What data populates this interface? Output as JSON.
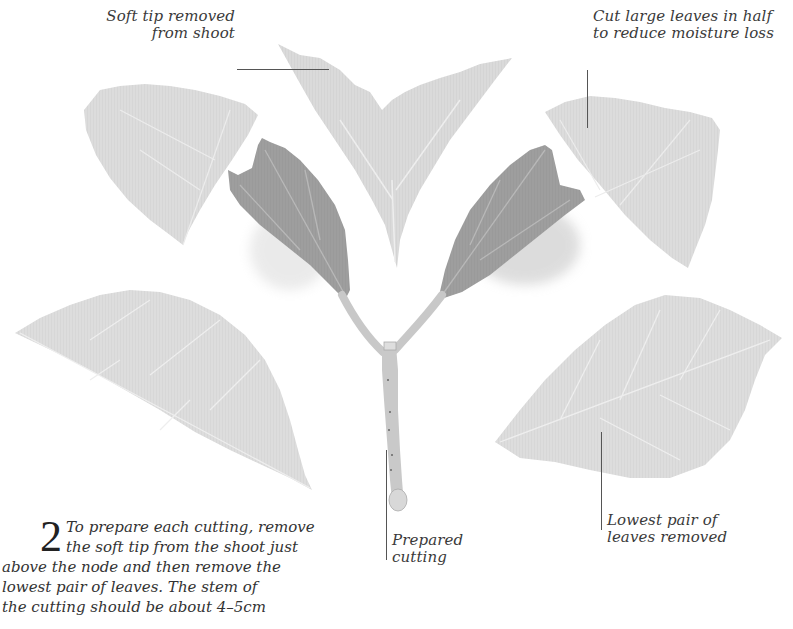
{
  "labels": {
    "soft_tip": [
      "Soft tip removed",
      "from shoot"
    ],
    "cut_leaves": [
      "Cut large leaves in half",
      "to reduce moisture loss"
    ],
    "prepared_cutting": [
      "Prepared",
      "cutting"
    ],
    "lowest_pair": [
      "Lowest pair of",
      "leaves removed"
    ]
  },
  "step": {
    "number": "2",
    "lines": [
      "To prepare each cutting, remove",
      "the soft tip from the shoot just",
      "above the node and then remove the",
      "lowest pair of leaves. The stem of",
      "the cutting should be about 4–5cm"
    ]
  },
  "colors": {
    "pale_leaf": "#d9d9d9",
    "dark_leaf": "#9a9a9a",
    "stem": "#c4c4c4",
    "text": "#333333"
  }
}
